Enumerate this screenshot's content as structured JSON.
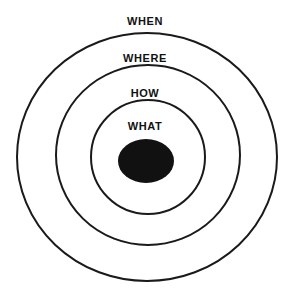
{
  "diagram": {
    "type": "concentric-circles",
    "title": "",
    "background_color": "#ffffff",
    "stroke_color": "#1a1a1a",
    "core_fill_color": "#111111",
    "label_color": "#111111",
    "rings": [
      {
        "label": "WHEN",
        "level": 4,
        "role": "outermost-ring",
        "center_x": 147,
        "center_y": 157,
        "radius_x": 130,
        "radius_y": 124,
        "stroke_width": 2
      },
      {
        "label": "WHERE",
        "level": 3,
        "role": "second-ring",
        "center_x": 148,
        "center_y": 155,
        "radius_x": 92,
        "radius_y": 90,
        "stroke_width": 2
      },
      {
        "label": "HOW",
        "level": 2,
        "role": "third-ring",
        "center_x": 148,
        "center_y": 157,
        "radius_x": 57,
        "radius_y": 57,
        "stroke_width": 2
      },
      {
        "label": "WHAT",
        "level": 1,
        "role": "filled-core",
        "center_x": 146,
        "center_y": 161,
        "radius_x": 28,
        "radius_y": 22,
        "stroke_width": 0
      }
    ]
  }
}
